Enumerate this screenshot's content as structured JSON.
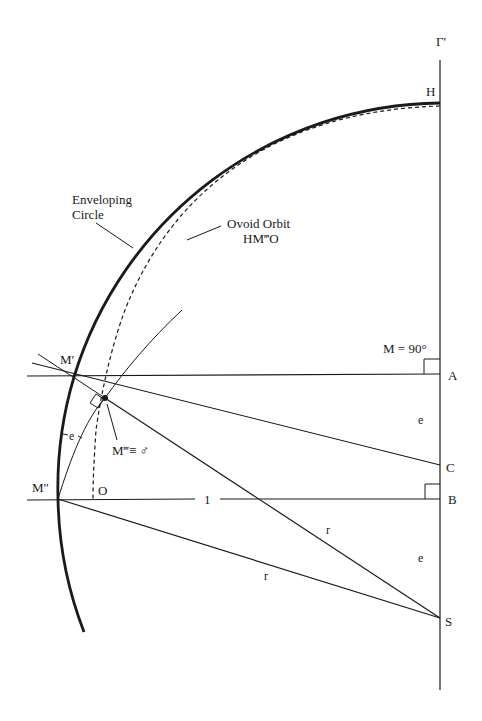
{
  "diagram": {
    "labels": {
      "axis": "Γ′",
      "H": "H",
      "A": "A",
      "B": "B",
      "C": "C",
      "S": "S",
      "O": "O",
      "M_prime": "M′",
      "M_double_prime": "M″",
      "M_triple_prime": "M‴≡ ♂",
      "angle": "M = 90°",
      "one": "1",
      "e_left": "e",
      "e_AC": "e",
      "e_BS": "e",
      "r_upper": "r",
      "r_lower": "r"
    },
    "annotations": {
      "enveloping_line1": "Enveloping",
      "enveloping_line2": "Circle",
      "ovoid_line1": "Ovoid Orbit",
      "ovoid_line2": "HM‴O"
    },
    "colors": {
      "ink": "#1a1a1a",
      "background": "#ffffff"
    }
  }
}
